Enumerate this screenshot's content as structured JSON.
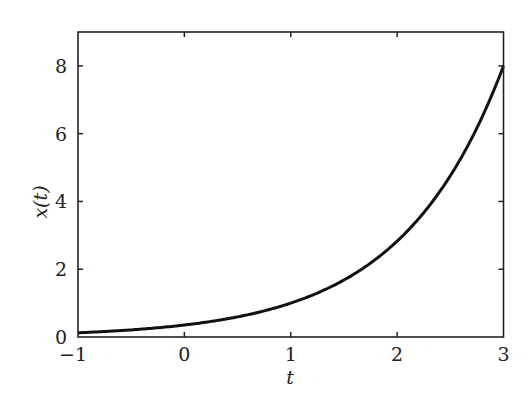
{
  "chart_data": {
    "type": "line",
    "title": "",
    "xlabel": "t",
    "ylabel": "x(t)",
    "xlim": [
      -1,
      3
    ],
    "ylim": [
      0,
      9
    ],
    "xticks": [
      -1,
      0,
      1,
      2,
      3
    ],
    "yticks": [
      0,
      2,
      4,
      6,
      8
    ],
    "xtick_labels": [
      "−1",
      "0",
      "1",
      "2",
      "3"
    ],
    "ytick_labels": [
      "0",
      "2",
      "4",
      "6",
      "8"
    ],
    "grid": false,
    "legend": null,
    "mirrored_ticks": true,
    "series": [
      {
        "name": "x(t)",
        "color": "#111111",
        "x": [
          -1,
          -0.5,
          0,
          0.5,
          1,
          1.5,
          2,
          2.5,
          3
        ],
        "values": [
          0.125,
          0.21,
          0.354,
          0.595,
          1.0,
          1.68,
          2.83,
          4.76,
          8.0
        ]
      }
    ]
  },
  "axis_color": "#222222"
}
